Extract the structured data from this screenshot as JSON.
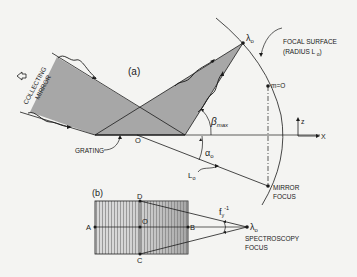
{
  "figure": {
    "part_a": {
      "label": "(a)",
      "collecting_mirror_label": [
        "COLLECTING",
        "MIRROR"
      ],
      "focal_surface_label": "FOCAL SURFACE",
      "focal_surface_radius_label": "(RADIUS L",
      "focal_surface_radius_sub": "o",
      "focal_surface_radius_close": ")",
      "lambda_label": "λ",
      "lambda_sub": "o",
      "m_zero_label": "m=O",
      "beta_label": "β",
      "beta_sub": "max",
      "alpha_label": "α",
      "alpha_sub": "o",
      "L_label": "L",
      "L_sub": "o",
      "origin_label": "O",
      "grating_label": "GRATING",
      "mirror_focus_label": [
        "MIRROR",
        "FOCUS"
      ],
      "axis_z_label": "z",
      "axis_x_label": "X"
    },
    "part_b": {
      "label": "(b)",
      "point_A": "A",
      "point_B": "B",
      "point_C": "C",
      "point_D": "D",
      "point_O": "O",
      "f_label": "f",
      "f_sub": "y",
      "f_sup": "-1",
      "lambda_label": "λ",
      "lambda_sub": "o",
      "spectroscopy_focus_label": [
        "SPECTROSCOPY",
        "FOCUS"
      ]
    }
  },
  "colors": {
    "background": "#f4f4f2",
    "ink": "#1a1a1a",
    "shade": "#a9a9a9",
    "shade_dark": "#8e8e8e"
  }
}
